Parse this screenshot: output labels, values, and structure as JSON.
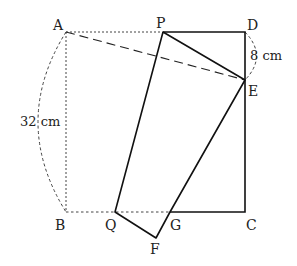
{
  "diagram": {
    "type": "geometry-folding-rectangle",
    "points": {
      "A": {
        "label": "A",
        "x": 66,
        "y": 32
      },
      "P": {
        "label": "P",
        "x": 163,
        "y": 32
      },
      "D": {
        "label": "D",
        "x": 245,
        "y": 32
      },
      "E": {
        "label": "E",
        "x": 245,
        "y": 80
      },
      "B": {
        "label": "B",
        "x": 66,
        "y": 212
      },
      "Q": {
        "label": "Q",
        "x": 115,
        "y": 212
      },
      "G": {
        "label": "G",
        "x": 170,
        "y": 212
      },
      "C": {
        "label": "C",
        "x": 245,
        "y": 212
      },
      "F": {
        "label": "F",
        "x": 156,
        "y": 238
      }
    },
    "measurements": {
      "AB": "32 cm",
      "DE": "8 cm"
    },
    "colors": {
      "stroke": "#111111",
      "dotted": "#444444",
      "text": "#222222"
    }
  }
}
